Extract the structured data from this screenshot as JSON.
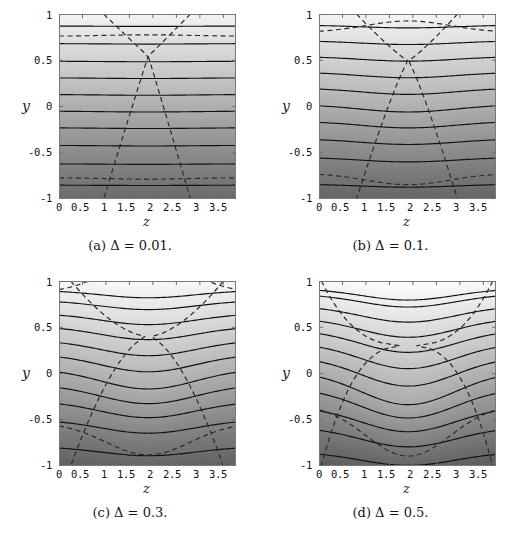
{
  "figure": {
    "panel_count": 4,
    "axis": {
      "xlabel": "z",
      "ylabel": "y",
      "xticks": [
        "0",
        "0.5",
        "1",
        "1.5",
        "2",
        "2.5",
        "3",
        "3.5"
      ],
      "xtick_values": [
        0,
        0.5,
        1,
        1.5,
        2,
        2.5,
        3,
        3.5
      ],
      "yticks": [
        "1",
        "0.5",
        "0",
        "-0.5",
        "-1"
      ],
      "ytick_values": [
        1,
        0.5,
        0,
        -0.5,
        -1
      ],
      "xlim": [
        0,
        3.77
      ],
      "ylim": [
        -1,
        1
      ]
    },
    "colors": {
      "frame": "#7a7a7a",
      "contour_solid": "#111111",
      "contour_dashed": "#2a2a2a",
      "shade_light": "#f0f0f0",
      "shade_dark": "#6a6a6a",
      "background": "#ffffff",
      "text": "#151515"
    }
  },
  "panels": [
    {
      "id": "a",
      "caption": "(a)  Δ = 0.01.",
      "label": "(a)",
      "parameter_name": "Δ",
      "parameter_value": "0.01",
      "amplitude": 0.012,
      "dash_style": "vertical-lines",
      "dashed_vertical_z": [
        0.95,
        2.8
      ]
    },
    {
      "id": "b",
      "caption": "(b)  Δ = 0.1.",
      "label": "(b)",
      "parameter_name": "Δ",
      "parameter_value": "0.1",
      "amplitude": 0.1,
      "dash_style": "bowed-lines",
      "dashed_vertical_z": [
        0.8,
        2.95
      ]
    },
    {
      "id": "c",
      "caption": "(c)  Δ = 0.3.",
      "label": "(c)",
      "parameter_name": "Δ",
      "parameter_value": "0.3",
      "amplitude": 0.28,
      "dash_style": "diagonal-x",
      "dashed_vertical_z": [
        0.25,
        3.5
      ]
    },
    {
      "id": "d",
      "caption": "(d)  Δ = 0.5.",
      "label": "(d)",
      "parameter_name": "Δ",
      "parameter_value": "0.5",
      "amplitude": 0.45,
      "dash_style": "diagonal-x",
      "dashed_vertical_z": [
        0.05,
        3.7
      ]
    }
  ],
  "chart_data": {
    "type": "heatmap",
    "title": "",
    "xlabel": "z",
    "ylabel": "y",
    "xlim": [
      0,
      3.77
    ],
    "ylim": [
      -1,
      1
    ],
    "grid": false,
    "legend": "none",
    "panels": [
      {
        "label": "(a)",
        "parameter": "Δ = 0.01",
        "amplitude": 0.012,
        "solid_contour_levels_y_at_z0": [
          0.87,
          0.68,
          0.49,
          0.31,
          0.13,
          -0.05,
          -0.23,
          -0.42,
          -0.62,
          -0.85
        ],
        "dashed_contour_levels_y_at_z0": [
          0.76,
          -0.77
        ],
        "shade_min": 0.42,
        "shade_max": 0.96
      },
      {
        "label": "(b)",
        "parameter": "Δ = 0.1",
        "amplitude": 0.1,
        "solid_contour_levels_y_at_z0": [
          0.88,
          0.71,
          0.54,
          0.37,
          0.2,
          0.02,
          -0.16,
          -0.35,
          -0.55,
          -0.84
        ],
        "dashed_contour_levels_y_at_z0": [
          0.8,
          -0.72
        ],
        "shade_min": 0.4,
        "shade_max": 0.96
      },
      {
        "label": "(c)",
        "parameter": "Δ = 0.3",
        "amplitude": 0.28,
        "solid_contour_levels_y_at_z0": [
          0.9,
          0.79,
          0.65,
          0.51,
          0.36,
          0.21,
          0.05,
          -0.12,
          -0.3,
          -0.5,
          -0.79
        ],
        "dashed_contour_levels_y_at_z0": [
          0.87,
          -0.53
        ],
        "shade_min": 0.38,
        "shade_max": 0.97
      },
      {
        "label": "(d)",
        "parameter": "Δ = 0.5",
        "amplitude": 0.45,
        "solid_contour_levels_y_at_z0": [
          0.92,
          0.86,
          0.73,
          0.6,
          0.47,
          0.33,
          0.18,
          0.02,
          -0.16,
          -0.36,
          -0.58,
          -0.85
        ],
        "dashed_contour_levels_y_at_z0": [
          0.93,
          -0.33
        ],
        "shade_min": 0.36,
        "shade_max": 0.98
      }
    ]
  }
}
